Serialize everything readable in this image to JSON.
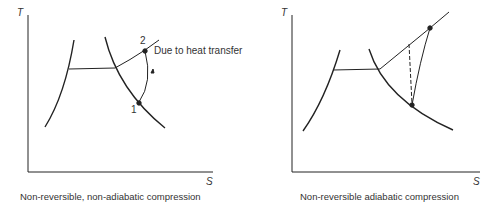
{
  "panels": [
    {
      "caption": "Non-reversible, non-adiabatic compression",
      "y_axis_label": "T",
      "x_axis_label": "S",
      "point_labels": [
        "1",
        "2"
      ],
      "annotation": "Due to heat transfer"
    },
    {
      "caption": "Non-reversible adiabatic compression",
      "y_axis_label": "T",
      "x_axis_label": "S"
    }
  ],
  "colors": {
    "line": "#222222",
    "text": "#333333"
  }
}
